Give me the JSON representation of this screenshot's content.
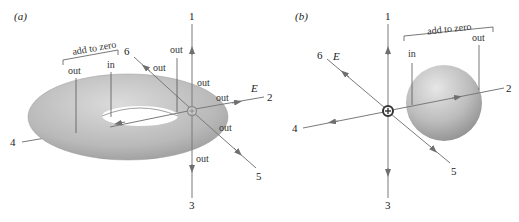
{
  "panels": [
    {
      "id": "a",
      "label": "(a)",
      "surface": "torus",
      "bracket_label": "add to zero",
      "field_label": "E",
      "bracket_items": [
        "out",
        "in"
      ],
      "flux_labels": [
        "out",
        "out",
        "out",
        "out",
        "out",
        "out"
      ],
      "line_numbers": [
        "1",
        "2",
        "3",
        "4",
        "5",
        "6"
      ]
    },
    {
      "id": "b",
      "label": "(b)",
      "surface": "sphere",
      "bracket_label": "add to zero",
      "field_label": "E",
      "bracket_items": [
        "in",
        "out"
      ],
      "line_numbers": [
        "1",
        "2",
        "3",
        "4",
        "5",
        "6"
      ]
    }
  ],
  "colors": {
    "field_line": "#7a7a7a",
    "surface_light": "#d8d8d8",
    "surface_dark": "#9a9a9a",
    "text": "#333333",
    "charge": "#555555"
  }
}
